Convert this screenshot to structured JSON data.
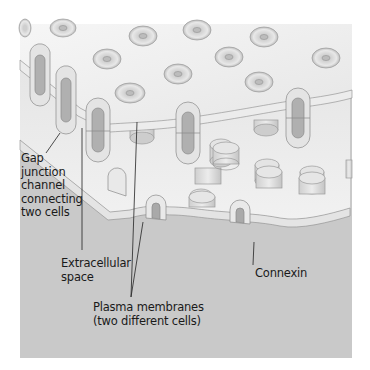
{
  "diagram": {
    "colors": {
      "background": "#ffffff",
      "panel": "#c9c9c9",
      "membrane_top": "#f1f1f1",
      "membrane_edge": "#dcdcdc",
      "connexon": "#d9d9d9",
      "connexon_pore": "#a9a9a9",
      "line": "#222222",
      "text": "#1a1a1a"
    },
    "labels": {
      "gap_junction": "Gap\njunction\nchannel\nconnecting\ntwo cells",
      "extracellular": "Extracellular\nspace",
      "plasma_membranes": "Plasma membranes\n(two different cells)",
      "connexin": "Connexin"
    }
  }
}
